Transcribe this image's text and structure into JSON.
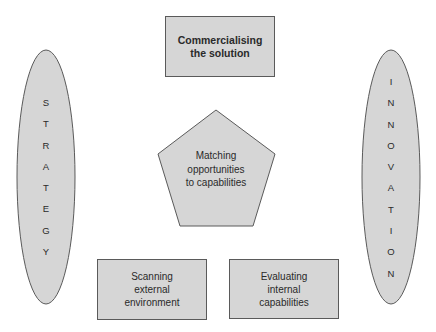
{
  "diagram": {
    "colors": {
      "shape_fill": "#d6d6d6",
      "shape_stroke": "#5a5a5a",
      "text": "#2a2a2a",
      "background": "#ffffff"
    },
    "left_ellipse": {
      "label": "STRATEGY",
      "letters": [
        "S",
        "T",
        "R",
        "A",
        "T",
        "E",
        "G",
        "Y"
      ]
    },
    "right_ellipse": {
      "label": "INNOVATION",
      "letters": [
        "I",
        "N",
        "N",
        "O",
        "V",
        "A",
        "T",
        "I",
        "O",
        "N"
      ]
    },
    "top_box": {
      "label": "Commercialising\nthe solution"
    },
    "center_pentagon": {
      "label": "Matching\nopportunities\nto capabilities"
    },
    "bottom_left_box": {
      "label": "Scanning\nexternal\nenvironment"
    },
    "bottom_right_box": {
      "label": "Evaluating\ninternal\ncapabilities"
    }
  }
}
